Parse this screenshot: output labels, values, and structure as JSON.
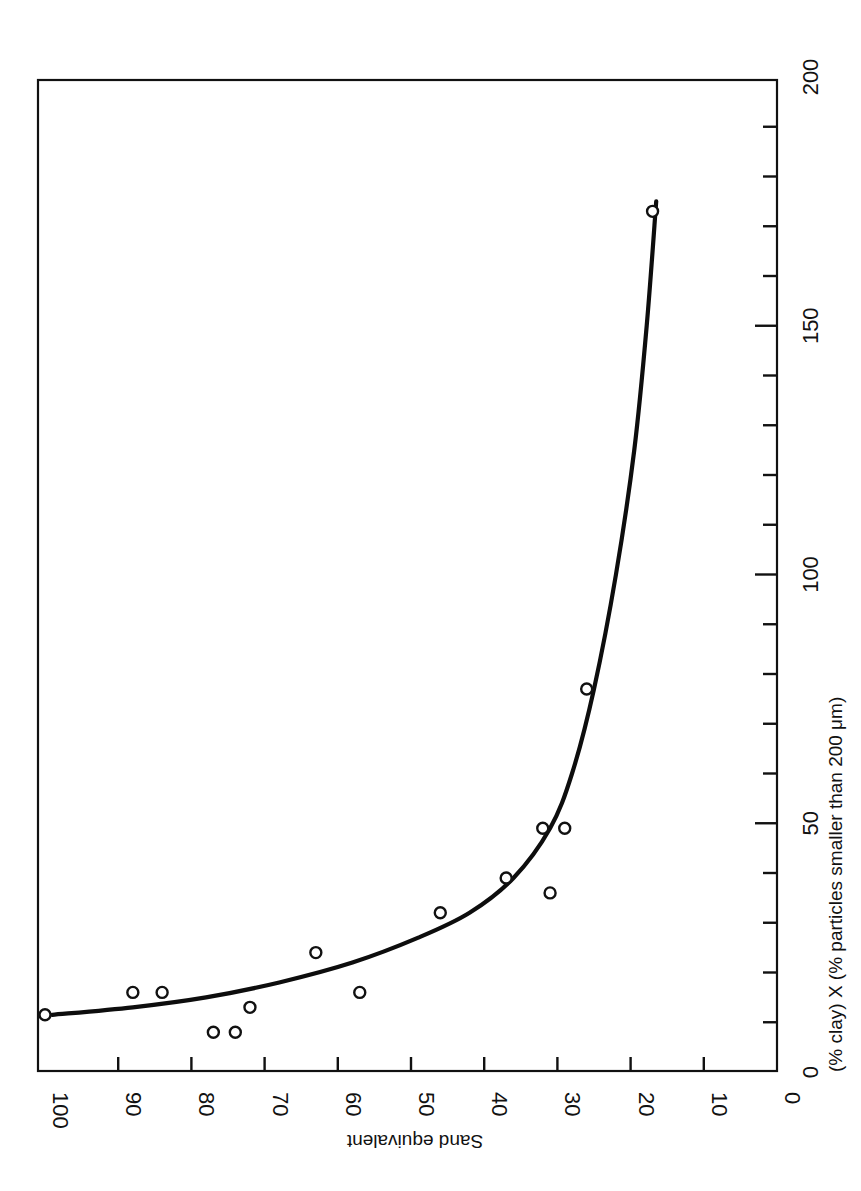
{
  "chart_data": {
    "type": "scatter",
    "orientation_note": "figure printed rotated 90 degrees clockwise",
    "title": "",
    "xlabel": "(% clay) X (% particles smaller than 200 μm)",
    "ylabel": "Sand equivalent",
    "xlim": [
      0,
      200
    ],
    "ylim": [
      0,
      100
    ],
    "x_ticks": [
      0,
      50,
      100,
      150,
      200
    ],
    "x_minor_step": 10,
    "y_ticks": [
      0,
      10,
      20,
      30,
      40,
      50,
      60,
      70,
      80,
      90,
      100
    ],
    "grid": false,
    "legend": null,
    "series": [
      {
        "name": "observations",
        "marker": "open-circle",
        "points": [
          {
            "x": 11.5,
            "y": 100
          },
          {
            "x": 16,
            "y": 88
          },
          {
            "x": 16,
            "y": 84
          },
          {
            "x": 8,
            "y": 77
          },
          {
            "x": 8,
            "y": 74
          },
          {
            "x": 13,
            "y": 72
          },
          {
            "x": 24,
            "y": 63
          },
          {
            "x": 16,
            "y": 57
          },
          {
            "x": 32,
            "y": 46
          },
          {
            "x": 39,
            "y": 37
          },
          {
            "x": 36,
            "y": 31
          },
          {
            "x": 49,
            "y": 32
          },
          {
            "x": 49,
            "y": 29
          },
          {
            "x": 77,
            "y": 26
          },
          {
            "x": 173,
            "y": 17
          }
        ]
      },
      {
        "name": "fitted curve",
        "type": "line",
        "points": [
          {
            "x": 11.5,
            "y": 99
          },
          {
            "x": 13,
            "y": 88
          },
          {
            "x": 15,
            "y": 78
          },
          {
            "x": 18,
            "y": 68
          },
          {
            "x": 22,
            "y": 58
          },
          {
            "x": 27,
            "y": 49
          },
          {
            "x": 32,
            "y": 42
          },
          {
            "x": 39,
            "y": 36
          },
          {
            "x": 49,
            "y": 31
          },
          {
            "x": 60,
            "y": 28
          },
          {
            "x": 77,
            "y": 25
          },
          {
            "x": 100,
            "y": 22
          },
          {
            "x": 125,
            "y": 19.5
          },
          {
            "x": 150,
            "y": 17.8
          },
          {
            "x": 175,
            "y": 16.5
          }
        ]
      }
    ]
  },
  "labels": {
    "x_axis_title": "(% clay) X (% particles smaller than 200 μm)",
    "y_axis_title": "Sand equivalent",
    "x_tick_labels": [
      "0",
      "50",
      "100",
      "150",
      "200"
    ],
    "y_tick_labels": [
      "100",
      "90",
      "80",
      "70",
      "60",
      "50",
      "40",
      "30",
      "20",
      "10",
      "0"
    ]
  },
  "colors": {
    "ink": "#111111",
    "background": "#ffffff"
  }
}
